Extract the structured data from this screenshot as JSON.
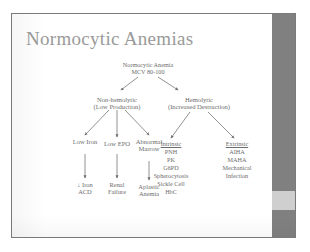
{
  "slide": {
    "title": "Normocytic Anemias",
    "title_color": "#9a9a9a",
    "text_color": "#6d6d6d",
    "background": "#ffffff",
    "scrollbar_color": "#808080",
    "scrollbar_thumb_color": "#cfcfcf"
  },
  "diagram": {
    "type": "flowchart",
    "root": {
      "line1": "Normocytic Anemia",
      "line2": "MCV 80-100"
    },
    "branch_left": {
      "line1": "Non-hemolytic",
      "line2": "(Low Production)"
    },
    "branch_right": {
      "line1": "Hemolytic",
      "line2": "(Increased Destruction)"
    },
    "nonhemolytic_causes": [
      {
        "line1": "Low Iron",
        "line2": ""
      },
      {
        "line1": "Low EPO",
        "line2": ""
      },
      {
        "line1": "Abnormal",
        "line2": "Marrow"
      }
    ],
    "nonhemolytic_diagnoses": [
      {
        "line1": "↓ Iron",
        "line2": "ACD"
      },
      {
        "line1": "Renal",
        "line2": "Failure"
      },
      {
        "line1": "Aplastic",
        "line2": "Anemia"
      }
    ],
    "intrinsic": {
      "heading": "Intrinsic",
      "items": [
        "PNH",
        "PK",
        "G6PD",
        "Spherocytosis",
        "Sickle Cell",
        "HbC"
      ]
    },
    "extrinsic": {
      "heading": "Extrinsic",
      "items": [
        "AIHA",
        "MAHA",
        "Mechanical",
        "Infection"
      ]
    }
  }
}
